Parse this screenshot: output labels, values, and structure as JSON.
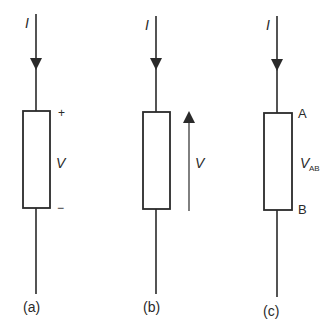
{
  "colors": {
    "stroke": "#2a2a2a",
    "background": "#ffffff"
  },
  "panels": [
    {
      "id": "a",
      "caption": "(a)",
      "current_label": "I",
      "voltage_label": "V",
      "plus_label": "+",
      "minus_label": "−"
    },
    {
      "id": "b",
      "caption": "(b)",
      "current_label": "I",
      "voltage_label": "V"
    },
    {
      "id": "c",
      "caption": "(c)",
      "current_label": "I",
      "voltage_label": "V",
      "voltage_subscript": "AB",
      "top_node_label": "A",
      "bottom_node_label": "B"
    }
  ]
}
